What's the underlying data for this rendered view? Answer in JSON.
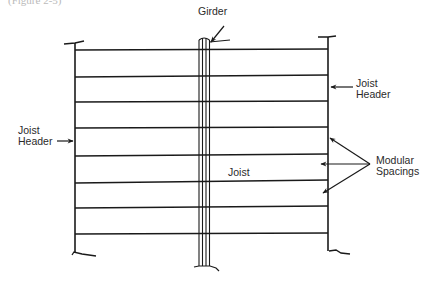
{
  "caption_fragment": "(Figure 2-5)",
  "labels": {
    "girder": "Girder",
    "joist_header_right_line1": "Joist",
    "joist_header_right_line2": "Header",
    "joist_header_left_line1": "Joist",
    "joist_header_left_line2": "Header",
    "joist": "Joist",
    "modular_spacings_line1": "Modular",
    "modular_spacings_line2": "Spacings"
  },
  "geometry": {
    "left_header_x": 75,
    "right_header_x": 328,
    "girder_x": [
      200,
      203,
      206,
      209
    ],
    "joist_y": [
      50,
      77,
      102,
      128,
      156,
      183,
      208,
      234
    ]
  },
  "colors": {
    "line": "#1a1a1a",
    "text": "#2a2a2a",
    "background": "#ffffff"
  }
}
